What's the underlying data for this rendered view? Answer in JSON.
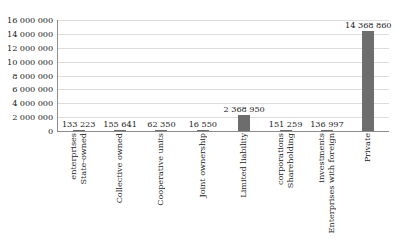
{
  "top_bleed_text": "",
  "chart_data": {
    "type": "bar",
    "title": "",
    "subtitle": "",
    "xlabel": "",
    "ylabel": "",
    "ylim": [
      0,
      16000000
    ],
    "ytick_step": 2000000,
    "grid": true,
    "legend": false,
    "bar_color": "#6d6d6d",
    "gridline_color": "#dddddd",
    "axis_color": "#8d8d8d",
    "categories": [
      "State-owned enterprises",
      "Collective owned",
      "Cooperative units",
      "Joint ownership",
      "Limited liability",
      "Shareholding corporations",
      "Enterprises with foreign investments",
      "Private"
    ],
    "category_lines": [
      [
        "State-owned",
        "enterprises"
      ],
      [
        "Collective owned"
      ],
      [
        "Cooperative units"
      ],
      [
        "Joint ownership"
      ],
      [
        "Limited liability"
      ],
      [
        "Shareholding",
        "corporations"
      ],
      [
        "Enterprises with foreign",
        "investments"
      ],
      [
        "Private"
      ]
    ],
    "values": [
      133223,
      155641,
      62350,
      16550,
      2368950,
      151259,
      136997,
      14368860
    ],
    "value_labels": [
      "133 223",
      "155 641",
      "62 350",
      "16 550",
      "2 368 950",
      "151 259",
      "136 997",
      "14 368 860"
    ],
    "ytick_labels": [
      "16 000 000",
      "14 000 000",
      "12 000 000",
      "10 000 000",
      "8 000 000",
      "6 000 000",
      "4 000 000",
      "2 000 000",
      "0"
    ],
    "ytick_values": [
      16000000,
      14000000,
      12000000,
      10000000,
      8000000,
      6000000,
      4000000,
      2000000,
      0
    ]
  }
}
